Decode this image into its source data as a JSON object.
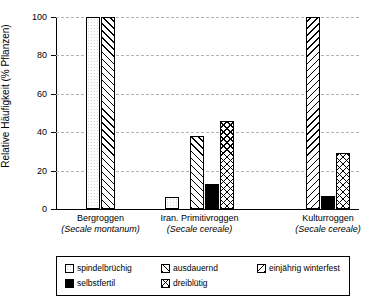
{
  "chart_data": {
    "type": "bar",
    "title": "",
    "xlabel": "",
    "ylabel": "Relative Häufigkeit (% Pflanzen)",
    "ylim": [
      0,
      100
    ],
    "yticks": [
      0,
      20,
      40,
      60,
      80,
      100
    ],
    "ytick_labels": [
      "0",
      "20",
      "40",
      "60",
      "80",
      "100"
    ],
    "grid": true,
    "grid_axis": "y",
    "legend_position": "below-axes",
    "categories": [
      "Bergroggen (Secale montanum)",
      "Iran. Primitivroggen (Secale cereale)",
      "Kulturroggen (Secale cereale)"
    ],
    "category_lines": [
      {
        "name": "Bergroggen",
        "species": "(Secale montanum)"
      },
      {
        "name": "Iran. Primitivroggen",
        "species": "(Secale cereale)"
      },
      {
        "name": "Kulturroggen",
        "species": "(Secale cereale)"
      }
    ],
    "series": [
      {
        "name": "spindelbrüchig",
        "pattern": "plain",
        "values": [
          100,
          6,
          0
        ]
      },
      {
        "name": "ausdauernd",
        "pattern": "fwd",
        "values": [
          100,
          38,
          0
        ]
      },
      {
        "name": "einjährig winterfest",
        "pattern": "back",
        "values": [
          0,
          0,
          100
        ]
      },
      {
        "name": "selbstfertil",
        "pattern": "solid",
        "values": [
          0,
          13,
          7
        ]
      },
      {
        "name": "dreiblütig",
        "pattern": "cross",
        "values": [
          0,
          46,
          29
        ]
      }
    ],
    "bars": [
      {
        "group": 0,
        "series": "spindelbrüchig",
        "pattern": "plain",
        "value": 100
      },
      {
        "group": 0,
        "series": "ausdauernd",
        "pattern": "fwd",
        "value": 100
      },
      {
        "group": 1,
        "series": "spindelbrüchig",
        "pattern": "plain",
        "value": 6
      },
      {
        "group": 1,
        "series": "ausdauernd",
        "pattern": "fwd",
        "value": 38
      },
      {
        "group": 1,
        "series": "selbstfertil",
        "pattern": "solid",
        "value": 13
      },
      {
        "group": 1,
        "series": "dreiblütig",
        "pattern": "cross",
        "value": 46
      },
      {
        "group": 2,
        "series": "einjährig winterfest",
        "pattern": "back",
        "value": 100
      },
      {
        "group": 2,
        "series": "selbstfertil",
        "pattern": "solid",
        "value": 7
      },
      {
        "group": 2,
        "series": "dreiblütig",
        "pattern": "cross",
        "value": 29
      }
    ]
  },
  "legend": {
    "items": [
      {
        "label": "spindelbrüchig",
        "pattern": "plain"
      },
      {
        "label": "ausdauernd",
        "pattern": "fwd"
      },
      {
        "label": "einjährig winterfest",
        "pattern": "back"
      },
      {
        "label": "selbstfertil",
        "pattern": "solid"
      },
      {
        "label": "dreiblütig",
        "pattern": "cross"
      }
    ]
  },
  "colors": {
    "axis": "#000000",
    "grid": "#b4b4b4",
    "background": "#ffffff",
    "bar_outline": "#000000",
    "solid_fill": "#000000"
  }
}
